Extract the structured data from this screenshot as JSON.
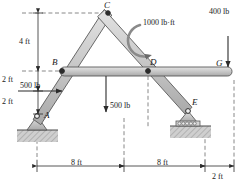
{
  "figure": {
    "type": "statics-free-body-diagram",
    "colors": {
      "member_fill": "#c9c9c9",
      "member_edge": "#5a5a5a",
      "ground": "#bdbdbd",
      "line": "#2b2b2b",
      "dash": "#555555",
      "text": "#1a1a1a"
    }
  },
  "joints": [
    {
      "label": "A",
      "x": 37,
      "y": 116
    },
    {
      "label": "B",
      "x": 62,
      "y": 71
    },
    {
      "label": "C",
      "x": 108,
      "y": 13
    },
    {
      "label": "D",
      "x": 148,
      "y": 71
    },
    {
      "label": "E",
      "x": 188,
      "y": 111
    },
    {
      "label": "G",
      "x": 228,
      "y": 71
    }
  ],
  "loads": [
    {
      "name": "load-500-horizontal",
      "label": "500 lb",
      "value": 500,
      "unit": "lb",
      "direction": "right"
    },
    {
      "name": "load-500-vertical",
      "label": "500 lb",
      "value": 500,
      "unit": "lb",
      "direction": "down"
    },
    {
      "name": "load-400-vertical",
      "label": "400 lb",
      "value": 400,
      "unit": "lb",
      "direction": "down"
    },
    {
      "name": "couple-moment",
      "label": "1000 lb·ft",
      "value": 1000,
      "unit": "lb·ft",
      "direction": "clockwise"
    }
  ],
  "dimensions": {
    "vertical": [
      {
        "name": "dim-4ft",
        "label": "4 ft"
      },
      {
        "name": "dim-2ft-upper",
        "label": "2 ft"
      },
      {
        "name": "dim-2ft-lower",
        "label": "2 ft"
      }
    ],
    "horizontal": [
      {
        "name": "dim-8ft-left",
        "label": "8 ft"
      },
      {
        "name": "dim-8ft-right",
        "label": "8 ft"
      },
      {
        "name": "dim-2ft-right",
        "label": "2 ft"
      }
    ]
  },
  "supports": [
    {
      "name": "pin-support-a",
      "at": "A",
      "kind": "pin"
    },
    {
      "name": "roller-support-e",
      "at": "E",
      "kind": "roller"
    }
  ],
  "members": [
    {
      "name": "member-ac",
      "from": "A",
      "to": "C"
    },
    {
      "name": "member-ce",
      "from": "C",
      "to": "E"
    },
    {
      "name": "member-bg",
      "from": "B",
      "to": "G"
    }
  ]
}
